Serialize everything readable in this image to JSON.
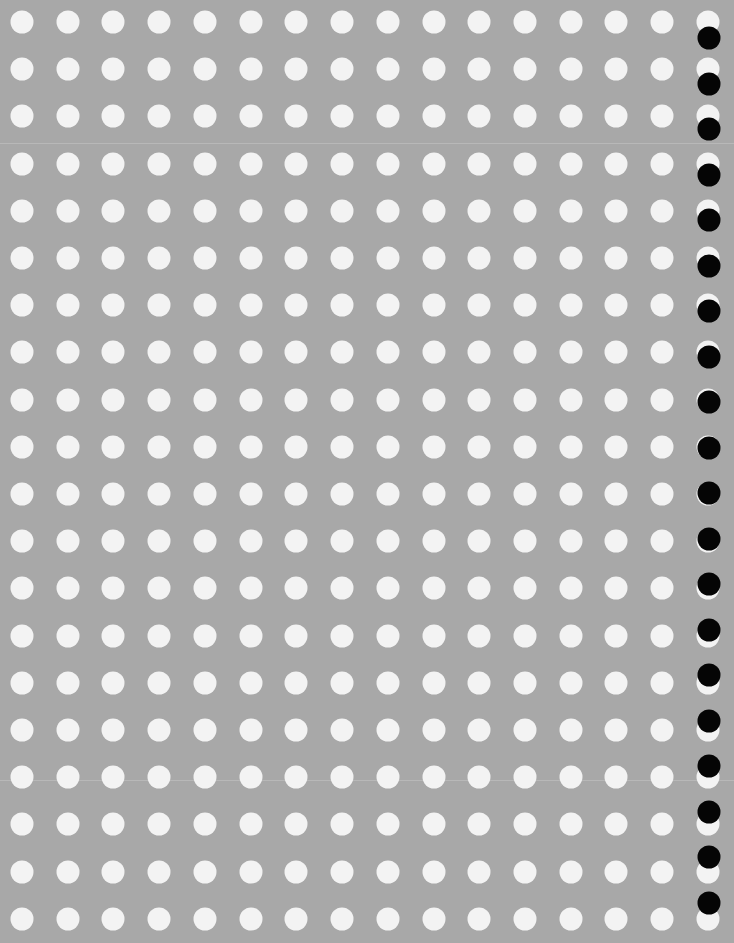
{
  "sheet": {
    "background_color": "#a8a8a8",
    "description": "Perforated gray sheet with a regular grid of white circular holes and a column of black dots along the right edge"
  },
  "grid": {
    "columns": 16,
    "rows": 20,
    "first_center_x": 22,
    "first_center_y": 22,
    "column_spacing": 45.73,
    "row_spacing": 47.2,
    "dot_diameter": 23,
    "dot_color": "#f3f3f3"
  },
  "edge_markers": {
    "count": 20,
    "center_x": 709,
    "first_center_y": 38,
    "spacing": 45.5,
    "diameter": 23,
    "color": "#050505"
  },
  "scan_lines": [
    143,
    780
  ]
}
